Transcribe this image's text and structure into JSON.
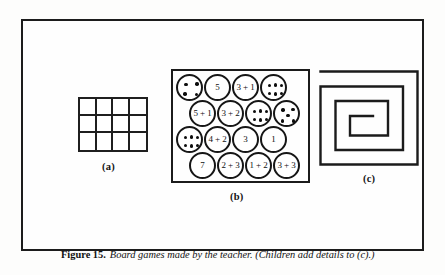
{
  "figure": {
    "caption_label": "Figure 15.",
    "caption_text": "Board games made by the teacher. (Children add details to (c).)"
  },
  "panels": {
    "a": {
      "label": "(a)",
      "type": "grid",
      "columns": 4,
      "rows": 3,
      "cell_count": 12
    },
    "b": {
      "label": "(b)",
      "type": "circle-board",
      "rows": [
        [
          {
            "kind": "dots",
            "count": 4,
            "text": ""
          },
          {
            "kind": "text",
            "text": "5"
          },
          {
            "kind": "text",
            "text": "3 + 1"
          },
          {
            "kind": "dots",
            "count": 6,
            "text": ""
          }
        ],
        [
          {
            "kind": "text",
            "text": "5 + 1"
          },
          {
            "kind": "text",
            "text": "3 + 2"
          },
          {
            "kind": "dots",
            "count": 6,
            "text": ""
          },
          {
            "kind": "dots",
            "count": 5,
            "text": ""
          }
        ],
        [
          {
            "kind": "dots",
            "count": 6,
            "text": ""
          },
          {
            "kind": "text",
            "text": "4 + 2"
          },
          {
            "kind": "text",
            "text": "3"
          },
          {
            "kind": "text",
            "text": "1"
          }
        ],
        [
          {
            "kind": "text",
            "text": "7"
          },
          {
            "kind": "text",
            "text": "2 + 3"
          },
          {
            "kind": "text",
            "text": "1 + 2"
          },
          {
            "kind": "text",
            "text": "3 + 3"
          }
        ]
      ]
    },
    "c": {
      "label": "(c)",
      "type": "rectangular-spiral"
    }
  },
  "colors": {
    "ink": "#141414",
    "paper": "#fdfdfc",
    "frame": "#1c1c1c"
  }
}
